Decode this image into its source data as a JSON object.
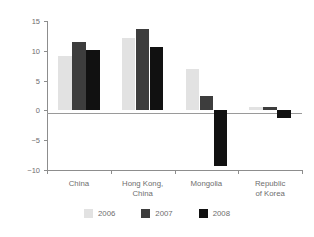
{
  "chart_data": {
    "type": "bar",
    "title": "",
    "xlabel": "",
    "ylabel": "Percentage of GDP",
    "categories": [
      "China",
      "Hong Kong,\nChina",
      "Mongolia",
      "Republic\nof Korea"
    ],
    "series": [
      {
        "name": "2006",
        "color": "#e2e2e2",
        "values": [
          9.2,
          12.2,
          7.0,
          0.6
        ]
      },
      {
        "name": "2007",
        "color": "#3d3d3d",
        "values": [
          11.5,
          13.6,
          2.5,
          0.6
        ]
      },
      {
        "name": "2008",
        "color": "#111111",
        "values": [
          10.2,
          10.7,
          -9.3,
          -1.3
        ]
      }
    ],
    "ylim": [
      -10,
      15
    ],
    "yticks": [
      15,
      10,
      5,
      0,
      -5,
      -10
    ],
    "ytick_labels": [
      "15",
      "10",
      "5",
      "0",
      "−5",
      "−10"
    ],
    "grid": false,
    "legend_position": "bottom"
  },
  "axis": {
    "y_title": "Percentage of GDP"
  },
  "legend": {
    "items": [
      {
        "label": "2006",
        "color": "#e2e2e2"
      },
      {
        "label": "2007",
        "color": "#3d3d3d"
      },
      {
        "label": "2008",
        "color": "#111111"
      }
    ]
  }
}
